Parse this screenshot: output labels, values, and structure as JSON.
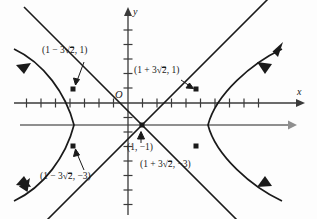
{
  "figure": {
    "type": "hyperbola-graph",
    "axes": {
      "x_label": "x",
      "y_label": "y",
      "origin_label": "O",
      "x_tick_count": 19,
      "y_tick_count": 13,
      "unit_px": 14.5
    },
    "center": {
      "x": 1,
      "y": -1,
      "label_text": "(1, −1)"
    },
    "asymptote_note": "two straight lines crossing at the center",
    "extra_line": {
      "description": "horizontal gray line y = -1",
      "color": "#8a8a8a"
    },
    "labels": [
      {
        "id": "upper-left",
        "prefix": "(1 − 3",
        "radical": "2",
        "suffix": ", 1)",
        "point": {
          "x": -3.243,
          "y": 1
        }
      },
      {
        "id": "upper-right",
        "prefix": "(1 + 3",
        "radical": "2",
        "suffix": ", 1)",
        "point": {
          "x": 5.243,
          "y": 1
        }
      },
      {
        "id": "lower-left",
        "prefix": "(1 − 3",
        "radical": "2",
        "suffix": ", −3)",
        "point": {
          "x": -3.243,
          "y": -3
        }
      },
      {
        "id": "lower-right",
        "prefix": "(1 + 3",
        "radical": "2",
        "suffix": ", −3)",
        "point": {
          "x": 5.243,
          "y": -3
        }
      }
    ],
    "colors": {
      "curve": "#1a1a1a",
      "axis": "#3a3a3a",
      "gray_line": "#8f8f8f",
      "text": "#1a1a1a"
    }
  }
}
